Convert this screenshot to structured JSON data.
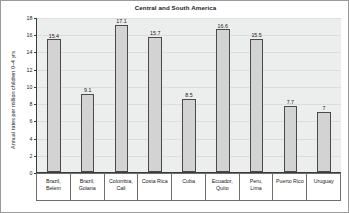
{
  "chart_data": {
    "type": "bar",
    "title": "Central and South America",
    "xlabel": "",
    "ylabel": "Annual rates per million children 0–4 yrs",
    "ylim": [
      0,
      18
    ],
    "yticks": [
      0,
      2,
      4,
      6,
      8,
      10,
      12,
      14,
      16,
      18
    ],
    "ytick_labels": [
      "0",
      "2",
      "4",
      "6",
      "8",
      "10",
      "12",
      "14",
      "16",
      "18"
    ],
    "grid": true,
    "legend": false,
    "categories": [
      "Brazil, Belem",
      "Brazil, Goiana",
      "Colombia, Cali",
      "Costa Rica",
      "Cuba",
      "Ecuador, Quito",
      "Peru, Lima",
      "Puerto Rico",
      "Uruguay"
    ],
    "category_lines": [
      [
        "Brazil,",
        "Belem"
      ],
      [
        "Brazil,",
        "Goiana"
      ],
      [
        "Colombia,",
        "Cali"
      ],
      [
        "Costa Rica"
      ],
      [
        "Cuba"
      ],
      [
        "Ecuador,",
        "Quito"
      ],
      [
        "Peru,",
        "Lima"
      ],
      [
        "Puerto Rico"
      ],
      [
        "Uruguay"
      ]
    ],
    "values": [
      15.4,
      9.1,
      17.1,
      15.7,
      8.5,
      16.6,
      15.5,
      7.7,
      7
    ],
    "value_labels": [
      "15.4",
      "9.1",
      "17.1",
      "15.7",
      "8.5",
      "16.6",
      "15.5",
      "7.7",
      "7"
    ],
    "colors": {
      "bar_fill": "#d3d3d3",
      "bar_edge": "#4a4a4a",
      "plot_background": "#eceded",
      "gridline": "#dcdddd",
      "axis": "#3b3b3b",
      "text": "#1a1a1a",
      "figure_border": "#9a9a9a"
    }
  }
}
